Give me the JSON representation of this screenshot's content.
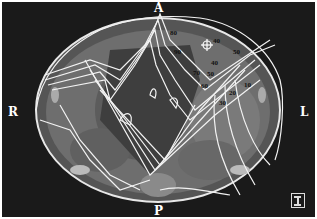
{
  "image": {
    "type": "axial CT slice with radiation isodose overlay",
    "orientation_labels": {
      "anterior": "A",
      "posterior": "P",
      "right": "R",
      "left": "L"
    },
    "isodose_labels": [
      {
        "value": "80",
        "x": 170,
        "y": 32
      },
      {
        "value": "90",
        "x": 174,
        "y": 51
      },
      {
        "value": "40",
        "x": 213,
        "y": 40
      },
      {
        "value": "50",
        "x": 233,
        "y": 51
      },
      {
        "value": "40",
        "x": 211,
        "y": 62
      },
      {
        "value": "70",
        "x": 193,
        "y": 72
      },
      {
        "value": "50",
        "x": 207,
        "y": 73
      },
      {
        "value": "60",
        "x": 203,
        "y": 85
      },
      {
        "value": "10",
        "x": 244,
        "y": 84
      },
      {
        "value": "20",
        "x": 229,
        "y": 92
      },
      {
        "value": "30",
        "x": 219,
        "y": 102
      }
    ],
    "scale_icon": "ruler-scale-icon",
    "colors": {
      "background": "#1a1a1a",
      "tissue": "#6e6e6e",
      "contour": "#f2f2f2"
    }
  }
}
